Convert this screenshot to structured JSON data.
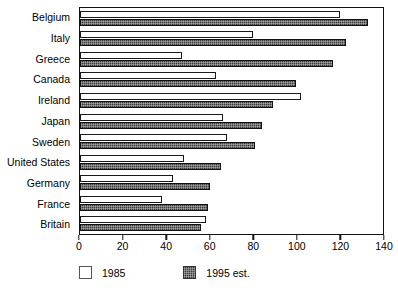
{
  "chart_data": {
    "type": "bar",
    "orientation": "horizontal",
    "title": "",
    "subtitle": "",
    "xlabel": "",
    "ylabel": "",
    "xlim": [
      0,
      140
    ],
    "xticks": [
      0,
      20,
      40,
      60,
      80,
      100,
      120,
      140
    ],
    "grid": false,
    "legend_position": "bottom-left",
    "categories": [
      "Belgium",
      "Italy",
      "Greece",
      "Canada",
      "Ireland",
      "Japan",
      "Sweden",
      "United States",
      "Germany",
      "France",
      "Britain"
    ],
    "series": [
      {
        "name": "1985",
        "values": [
          120,
          80,
          47,
          63,
          102,
          66,
          68,
          48,
          43,
          38,
          58
        ],
        "color": "#ffffff"
      },
      {
        "name": "1995 est.",
        "values": [
          133,
          123,
          117,
          100,
          89,
          84,
          81,
          65,
          60,
          59,
          56
        ],
        "color": "#3d3d3d"
      }
    ],
    "legend": [
      {
        "label": "1985",
        "swatch": "white"
      },
      {
        "label": "1995 est.",
        "swatch": "hatch"
      }
    ]
  }
}
